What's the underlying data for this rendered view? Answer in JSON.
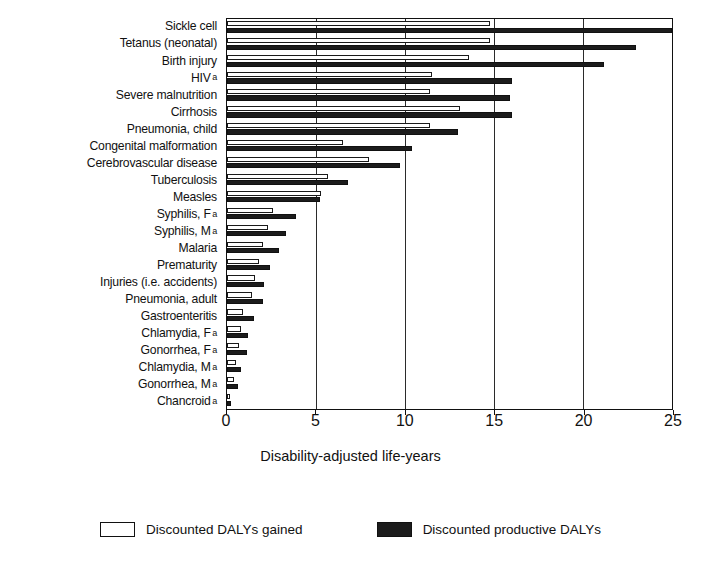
{
  "chart_data": {
    "type": "bar",
    "orientation": "horizontal",
    "title": "",
    "xlabel": "Disability-adjusted life-years",
    "ylabel": "",
    "xlim": [
      0,
      25
    ],
    "xticks": [
      0,
      5,
      10,
      15,
      20,
      25
    ],
    "xticklabels": [
      "0",
      "5",
      "10",
      "15",
      "20",
      "25"
    ],
    "grid": "vertical",
    "legend_position": "bottom",
    "categories": [
      "Sickle cell",
      "Tetanus (neonatal)",
      "Birth injury",
      "HIV",
      "Severe malnutrition",
      "Cirrhosis",
      "Pneumonia, child",
      "Congenital malformation",
      "Cerebrovascular disease",
      "Tuberculosis",
      "Measles",
      "Syphilis, F",
      "Syphilis, M",
      "Malaria",
      "Prematurity",
      "Injuries (i.e. accidents)",
      "Pneumonia, adult",
      "Gastroenteritis",
      "Chlamydia, F",
      "Gonorrhea, F",
      "Chlamydia, M",
      "Gonorrhea, M",
      "Chancroid"
    ],
    "category_footnotes": [
      "",
      "",
      "",
      "a",
      "",
      "",
      "",
      "",
      "",
      "",
      "",
      "a",
      "a",
      "",
      "",
      "",
      "",
      "",
      "a",
      "a",
      "a",
      "a",
      "a"
    ],
    "series": [
      {
        "name": "Discounted DALYs gained",
        "style": "white",
        "values": [
          14.8,
          14.8,
          13.6,
          11.5,
          11.4,
          13.1,
          11.4,
          6.5,
          8.0,
          5.7,
          5.3,
          2.6,
          2.3,
          2.0,
          1.8,
          1.6,
          1.4,
          0.9,
          0.8,
          0.7,
          0.5,
          0.4,
          0.15
        ]
      },
      {
        "name": "Discounted productive DALYs",
        "style": "black",
        "values": [
          25.0,
          23.0,
          21.2,
          16.0,
          15.9,
          16.0,
          13.0,
          10.4,
          9.7,
          6.8,
          5.2,
          3.9,
          3.3,
          2.9,
          2.4,
          2.1,
          2.0,
          1.5,
          1.2,
          1.1,
          0.8,
          0.6,
          0.2
        ]
      }
    ]
  },
  "legend": [
    {
      "label": "Discounted DALYs gained",
      "style": "white"
    },
    {
      "label": "Discounted productive DALYs",
      "style": "black"
    }
  ]
}
